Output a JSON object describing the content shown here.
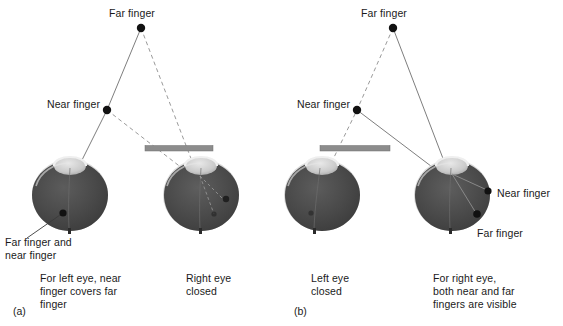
{
  "figure": {
    "background_color": "#ffffff",
    "line_color": "#7a7a7a",
    "dashed_color": "#8d8d8d",
    "dot_color": "#111111",
    "bar_color": "#8a8a8a",
    "text_color": "#1a1a1a",
    "sclera_color": "#d8d8d8",
    "eye_dark_color": "#474747",
    "lens_color": "#cfcfcf"
  },
  "panels": [
    {
      "id": "a",
      "letter": "(a)",
      "fingers": {
        "far_label": "Far finger",
        "near_label": "Near finger"
      },
      "eye_dot_label": "Far finger and\nnear finger",
      "eye_dot_label_line1": "Far finger and",
      "eye_dot_label_line2": "near finger",
      "captions": [
        {
          "name": "left-eye-caption",
          "lines": [
            "For left eye, near",
            "finger covers far",
            "finger"
          ]
        },
        {
          "name": "right-eye-caption",
          "lines": [
            "Right eye",
            "closed"
          ]
        }
      ]
    },
    {
      "id": "b",
      "letter": "(b)",
      "fingers": {
        "far_label": "Far finger",
        "near_label": "Near finger"
      },
      "eye_dot_labels": {
        "near": "Near finger",
        "far": "Far finger"
      },
      "captions": [
        {
          "name": "left-eye-caption",
          "lines": [
            "Left eye",
            "closed"
          ]
        },
        {
          "name": "right-eye-caption",
          "lines": [
            "For right eye,",
            "both near and far",
            "fingers are visible"
          ]
        }
      ]
    }
  ]
}
